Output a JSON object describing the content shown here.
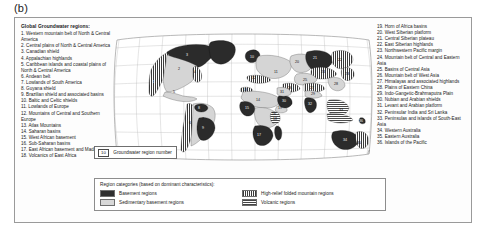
{
  "figure": {
    "panel_label": "(b)"
  },
  "left_column": {
    "heading": "Global Groundwater regions:",
    "items": [
      "1. Western mountain belt of North & Central America",
      "2. Central plains of North & Central America",
      "3. Canadian shield",
      "4. Appalachian highlands",
      "5. Caribbean islands and coastal plains of North & Central America",
      "6. Andean belt",
      "7. Lowlands of South America",
      "8. Guyana shield",
      "9. Brazilian shield and associated basins",
      "10. Baltic and Celtic shields",
      "11. Lowlands of Europe",
      "12. Mountains of Central and Southern Europe",
      "13. Atlas Mountains",
      "14. Saharan basins",
      "15. West African basement",
      "16. Sub-Saharan basins",
      "17. East African basement and Madagascar",
      "18. Volcanics of East Africa"
    ]
  },
  "right_column": {
    "items": [
      "19. Horn of Africa basins",
      "20. West Siberian platform",
      "21. Central Siberian plateau",
      "22. East Siberian highlands",
      "23. Northwestern Pacific margin",
      "24. Mountain belt of Central and Eastern Asia",
      "25. Basins of Central Asia",
      "26. Mountain belt of West Asia",
      "27. Himalayas and associated highlands",
      "28. Plains of Eastern China",
      "29. Indo-Gangetic-Brahmaputra Plain",
      "30. Nubian and Arabian shields",
      "31. Levant and Arabian platform",
      "32. Peninsular India and Sri Lanka",
      "33. Peninsulas and islands of South-East Asia",
      "34. Western Australia",
      "35. Eastern Australia",
      "36. Islands of the Pacific"
    ]
  },
  "map_key": {
    "chip": "10",
    "label": "Groundwater region number"
  },
  "legend": {
    "title": "Region categories (based on dominant characteristics):",
    "entries": [
      {
        "label": "Basement regions",
        "swatch": "basement-swatch",
        "color": "#2e2e2e"
      },
      {
        "label": "High-relief folded mountain regions",
        "swatch": "folded-mountain-swatch",
        "color": "#3b3b3b"
      },
      {
        "label": "Sedimentary basement regions",
        "swatch": "sedimentary-swatch",
        "color": "#d8d8d8"
      },
      {
        "label": "Volcanic regions",
        "swatch": "volcanic-swatch",
        "color": "#444444"
      }
    ]
  },
  "map": {
    "projection": "robinson",
    "region_numbers": [
      {
        "n": "1",
        "x": 47,
        "y": 60
      },
      {
        "n": "2",
        "x": 72,
        "y": 47
      },
      {
        "n": "3",
        "x": 80,
        "y": 33
      },
      {
        "n": "4",
        "x": 88,
        "y": 50
      },
      {
        "n": "5",
        "x": 67,
        "y": 70
      },
      {
        "n": "6",
        "x": 83,
        "y": 101
      },
      {
        "n": "7",
        "x": 96,
        "y": 97
      },
      {
        "n": "8",
        "x": 92,
        "y": 86
      },
      {
        "n": "9",
        "x": 96,
        "y": 106
      },
      {
        "n": "10",
        "x": 145,
        "y": 35
      },
      {
        "n": "11",
        "x": 169,
        "y": 50
      },
      {
        "n": "12",
        "x": 146,
        "y": 56
      },
      {
        "n": "13",
        "x": 138,
        "y": 68
      },
      {
        "n": "14",
        "x": 151,
        "y": 78
      },
      {
        "n": "15",
        "x": 140,
        "y": 86
      },
      {
        "n": "16",
        "x": 167,
        "y": 92
      },
      {
        "n": "17",
        "x": 152,
        "y": 113
      },
      {
        "n": "18",
        "x": 168,
        "y": 97
      },
      {
        "n": "19",
        "x": 172,
        "y": 86
      },
      {
        "n": "20",
        "x": 190,
        "y": 40
      },
      {
        "n": "21",
        "x": 208,
        "y": 36
      },
      {
        "n": "22",
        "x": 233,
        "y": 38
      },
      {
        "n": "23",
        "x": 240,
        "y": 52
      },
      {
        "n": "24",
        "x": 216,
        "y": 50
      },
      {
        "n": "25",
        "x": 198,
        "y": 58
      },
      {
        "n": "26",
        "x": 183,
        "y": 66
      },
      {
        "n": "27",
        "x": 205,
        "y": 66
      },
      {
        "n": "28",
        "x": 229,
        "y": 62
      },
      {
        "n": "29",
        "x": 206,
        "y": 72
      },
      {
        "n": "30",
        "x": 177,
        "y": 79
      },
      {
        "n": "31",
        "x": 175,
        "y": 70
      },
      {
        "n": "32",
        "x": 203,
        "y": 82
      },
      {
        "n": "33",
        "x": 234,
        "y": 88
      },
      {
        "n": "34",
        "x": 238,
        "y": 118
      },
      {
        "n": "35",
        "x": 252,
        "y": 121
      },
      {
        "n": "36",
        "x": 258,
        "y": 100
      }
    ]
  }
}
